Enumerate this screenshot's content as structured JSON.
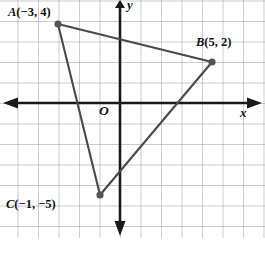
{
  "figure": {
    "type": "coordinate-plane-triangle",
    "width": 265,
    "height": 254,
    "background_color": "#ffffff",
    "grid_color": "#8a8f96",
    "axis_color": "#1a1a1a",
    "segment_color": "#4a4a4a",
    "point_color": "#555555",
    "text_color": "#111111"
  },
  "axes": {
    "x_axis_label": "x",
    "y_axis_label": "y",
    "origin_label": "O",
    "x_axis_pixel_y": 103,
    "y_axis_pixel_x": 120,
    "cell_size_px": 20.5,
    "x_range": [
      -6,
      7
    ],
    "y_range": [
      -7,
      5
    ],
    "grid": true,
    "x_arrow_both_ends": true,
    "y_arrow_both_ends": true,
    "tick_labels": []
  },
  "points": [
    {
      "name": "A",
      "label": "A",
      "coords_text": "(−3, 4)",
      "x": -3,
      "y": 4,
      "px": 58,
      "py": 24
    },
    {
      "name": "B",
      "label": "B",
      "coords_text": "(5, 2)",
      "x": 5,
      "y": 2,
      "px": 212,
      "py": 62
    },
    {
      "name": "C",
      "label": "C",
      "coords_text": "(−1, −5)",
      "x": -1,
      "y": -5,
      "px": 100,
      "py": 195
    }
  ],
  "segments": [
    {
      "name": "segment-AB",
      "from": "A",
      "to": "B"
    },
    {
      "name": "segment-BC",
      "from": "B",
      "to": "C"
    },
    {
      "name": "segment-CA",
      "from": "C",
      "to": "A"
    }
  ]
}
